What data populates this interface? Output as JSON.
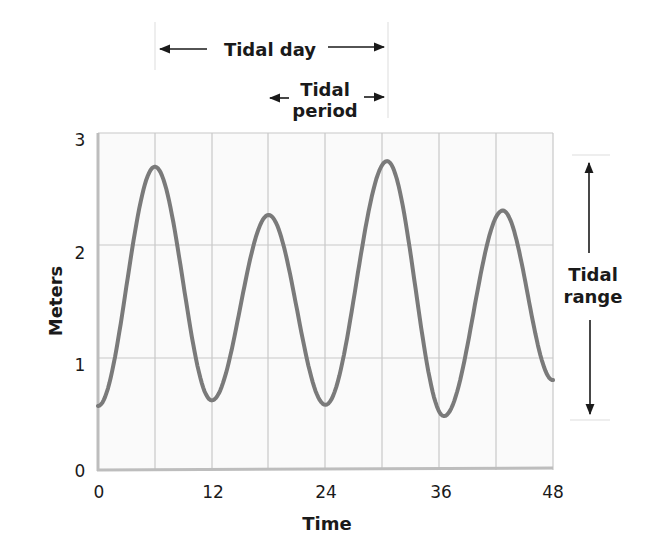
{
  "chart_data": {
    "type": "line",
    "title": "",
    "xlabel": "Time",
    "ylabel": "Meters",
    "xlim": [
      0,
      48
    ],
    "ylim": [
      0,
      3
    ],
    "x_ticks": [
      "0",
      "12",
      "24",
      "36",
      "48"
    ],
    "y_ticks": [
      "0",
      "1",
      "2",
      "3"
    ],
    "grid": true,
    "grid_x_step": 6,
    "grid_y_step": 1,
    "legend": null,
    "series": [
      {
        "name": "Tide height",
        "color": "#7a7a7a",
        "x": [
          0,
          6,
          12,
          18,
          24,
          30.5,
          36.5,
          42.7,
          48
        ],
        "y": [
          0.57,
          2.7,
          0.62,
          2.27,
          0.58,
          2.75,
          0.48,
          2.31,
          0.8
        ],
        "points_note": "alternating low/high tide extrema"
      }
    ],
    "annotations": [
      {
        "id": "tidal_day",
        "text": "Tidal day",
        "type": "horizontal-span",
        "x_start": 6,
        "x_end": 30.5
      },
      {
        "id": "tidal_period",
        "text_line1": "Tidal",
        "text_line2": "period",
        "type": "horizontal-span",
        "x_start": 18,
        "x_end": 30.5
      },
      {
        "id": "tidal_range",
        "text_line1": "Tidal",
        "text_line2": "range",
        "type": "vertical-span",
        "y_start": 0.48,
        "y_end": 2.75
      }
    ]
  },
  "labels": {
    "xlabel": "Time",
    "ylabel": "Meters",
    "tidal_day": "Tidal day",
    "tidal_period_1": "Tidal",
    "tidal_period_2": "period",
    "tidal_range_1": "Tidal",
    "tidal_range_2": "range",
    "x0": "0",
    "x12": "12",
    "x24": "24",
    "x36": "36",
    "x48": "48",
    "y0": "0",
    "y1": "1",
    "y2": "2",
    "y3": "3"
  },
  "colors": {
    "curve": "#7a7a7a",
    "grid": "#c8c8c8",
    "axis": "#bdbdbd",
    "plot_bg": "#fafafa",
    "text": "#1a1a1a"
  }
}
